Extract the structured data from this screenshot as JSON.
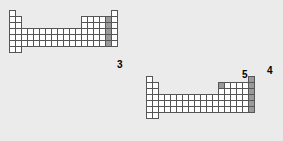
{
  "figure": {
    "background_color": "#ebebeb",
    "cell_fill_color": "#ffffff",
    "highlight_color": "#9a9a9a",
    "border_color": "#555555"
  },
  "tables": [
    {
      "id": "top-table",
      "x": 9,
      "y": 10,
      "cell_w": 7,
      "cell_h": 7,
      "columns": 18,
      "rows": 7,
      "grid": [
        [
          "plain",
          "empty",
          "empty",
          "empty",
          "empty",
          "empty",
          "empty",
          "empty",
          "empty",
          "empty",
          "empty",
          "empty",
          "empty",
          "empty",
          "empty",
          "empty",
          "empty",
          "plain"
        ],
        [
          "plain",
          "plain",
          "empty",
          "empty",
          "empty",
          "empty",
          "empty",
          "empty",
          "empty",
          "empty",
          "empty",
          "empty",
          "plain",
          "plain",
          "plain",
          "plain",
          "hl",
          "plain"
        ],
        [
          "plain",
          "plain",
          "empty",
          "empty",
          "empty",
          "empty",
          "empty",
          "empty",
          "empty",
          "empty",
          "empty",
          "empty",
          "plain",
          "plain",
          "plain",
          "plain",
          "hl",
          "plain"
        ],
        [
          "plain",
          "plain",
          "plain",
          "plain",
          "plain",
          "plain",
          "plain",
          "plain",
          "plain",
          "plain",
          "plain",
          "plain",
          "plain",
          "plain",
          "plain",
          "plain",
          "hl",
          "plain"
        ],
        [
          "plain",
          "plain",
          "plain",
          "plain",
          "plain",
          "plain",
          "plain",
          "plain",
          "plain",
          "plain",
          "plain",
          "plain",
          "plain",
          "plain",
          "plain",
          "plain",
          "hl",
          "plain"
        ],
        [
          "plain",
          "plain",
          "plain",
          "plain",
          "plain",
          "plain",
          "plain",
          "plain",
          "plain",
          "plain",
          "plain",
          "plain",
          "plain",
          "plain",
          "plain",
          "plain",
          "hl",
          "plain"
        ],
        [
          "plain",
          "plain",
          "empty",
          "empty",
          "empty",
          "empty",
          "empty",
          "empty",
          "empty",
          "empty",
          "empty",
          "empty",
          "empty",
          "empty",
          "empty",
          "empty",
          "empty",
          "empty"
        ]
      ],
      "labels": [
        {
          "text": "3",
          "x": 117,
          "y": 60,
          "font_size": 10
        }
      ]
    },
    {
      "id": "bottom-table",
      "x": 146,
      "y": 76,
      "cell_w": 7,
      "cell_h": 7,
      "columns": 18,
      "rows": 7,
      "grid": [
        [
          "plain",
          "empty",
          "empty",
          "empty",
          "empty",
          "empty",
          "empty",
          "empty",
          "empty",
          "empty",
          "empty",
          "empty",
          "empty",
          "empty",
          "empty",
          "empty",
          "empty",
          "hl"
        ],
        [
          "plain",
          "plain",
          "empty",
          "empty",
          "empty",
          "empty",
          "empty",
          "empty",
          "empty",
          "empty",
          "empty",
          "empty",
          "hl",
          "plain",
          "plain",
          "plain",
          "plain",
          "hl"
        ],
        [
          "plain",
          "plain",
          "empty",
          "empty",
          "empty",
          "empty",
          "empty",
          "empty",
          "empty",
          "empty",
          "empty",
          "empty",
          "plain",
          "plain",
          "plain",
          "plain",
          "plain",
          "hl"
        ],
        [
          "plain",
          "plain",
          "plain",
          "plain",
          "plain",
          "plain",
          "plain",
          "plain",
          "plain",
          "plain",
          "plain",
          "plain",
          "plain",
          "plain",
          "plain",
          "plain",
          "plain",
          "hl"
        ],
        [
          "plain",
          "plain",
          "plain",
          "plain",
          "plain",
          "plain",
          "plain",
          "plain",
          "plain",
          "plain",
          "plain",
          "plain",
          "plain",
          "plain",
          "plain",
          "plain",
          "plain",
          "hl"
        ],
        [
          "plain",
          "plain",
          "plain",
          "plain",
          "plain",
          "plain",
          "plain",
          "plain",
          "plain",
          "plain",
          "plain",
          "plain",
          "plain",
          "plain",
          "plain",
          "plain",
          "plain",
          "hl"
        ],
        [
          "plain",
          "plain",
          "empty",
          "empty",
          "empty",
          "empty",
          "empty",
          "empty",
          "empty",
          "empty",
          "empty",
          "empty",
          "empty",
          "empty",
          "empty",
          "empty",
          "empty",
          "empty"
        ]
      ],
      "labels": [
        {
          "text": "5",
          "x": 242,
          "y": 70,
          "font_size": 10
        },
        {
          "text": "4",
          "x": 267,
          "y": 66,
          "font_size": 10
        }
      ]
    }
  ]
}
